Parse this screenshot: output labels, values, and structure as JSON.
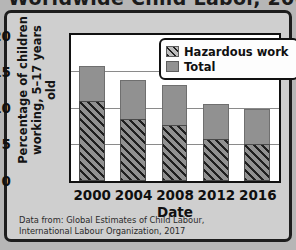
{
  "title": "Worldwide Child Labor, 2000–2016",
  "chart_data": {
    "type": "bar",
    "title": "",
    "xlabel": "Date",
    "ylabel": "Percentage of children working, 5–17 years old",
    "ylabel_line1": "Percentage of children",
    "ylabel_line2": "working, 5–17 years old",
    "categories": [
      "2000",
      "2004",
      "2008",
      "2012",
      "2016"
    ],
    "series": [
      {
        "name": "Hazardous work",
        "values": [
          11.1,
          8.5,
          7.7,
          5.8,
          5.1
        ]
      },
      {
        "name": "Total",
        "values": [
          15.9,
          14.0,
          13.3,
          10.6,
          9.9
        ]
      }
    ],
    "ylim": [
      0,
      20
    ],
    "yticks": [
      "0",
      "5",
      "10",
      "15",
      "20"
    ],
    "ytick_values": [
      0,
      5,
      10,
      15,
      20
    ],
    "grid": true,
    "legend_position": "top-right",
    "colors": {
      "total_fill": "#919191",
      "hazard_fill": "#919191",
      "hazard_hatch": "#1f1f1f",
      "plot_background": "#ffffff",
      "panel_background": "#cfcfcf",
      "frame": "#111111"
    }
  },
  "legend": {
    "items": [
      {
        "label": "Hazardous work",
        "style": "hatch"
      },
      {
        "label": "Total",
        "style": "solid"
      }
    ]
  },
  "caption": {
    "line1": "Data from: Global Estimates of Child Labour,",
    "line2": "International Labour Organization, 2017"
  }
}
